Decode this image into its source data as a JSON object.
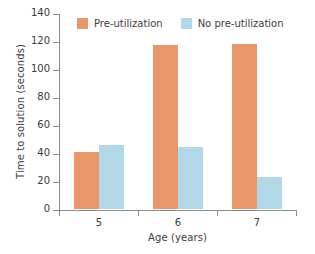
{
  "chart_data": {
    "type": "bar",
    "title": "",
    "xlabel": "Age (years)",
    "ylabel": "Time to solution (seconds)",
    "categories": [
      "5",
      "6",
      "7"
    ],
    "series": [
      {
        "name": "Pre-utilization",
        "color": "#e8966a",
        "values": [
          41,
          117,
          118
        ]
      },
      {
        "name": "No pre-utilization",
        "color": "#b2d8e8",
        "values": [
          46,
          44,
          23
        ]
      }
    ],
    "ylim": [
      0,
      140
    ],
    "yticks": [
      0,
      20,
      40,
      60,
      80,
      100,
      120,
      140
    ],
    "ytick_labels": [
      "0",
      "20",
      "40",
      "60",
      "80",
      "100",
      "120",
      "140"
    ],
    "grid": false,
    "legend_position": "top-left-inside"
  }
}
